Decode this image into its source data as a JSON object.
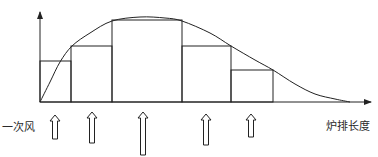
{
  "diagram": {
    "title": "",
    "labels": {
      "primary_air": "一次风",
      "grate_length": "炉排长度"
    },
    "colors": {
      "stroke": "#222222",
      "background": "#ffffff"
    },
    "axes": {
      "origin": [
        40,
        102
      ],
      "y_axis_top": 12,
      "x_axis_end": 371
    },
    "steps": [
      {
        "x0": 40,
        "x1": 71,
        "top": 61
      },
      {
        "x0": 71,
        "x1": 112,
        "top": 46
      },
      {
        "x0": 112,
        "x1": 182,
        "top": 20
      },
      {
        "x0": 182,
        "x1": 231,
        "top": 46
      },
      {
        "x0": 231,
        "x1": 273,
        "top": 70
      }
    ],
    "curve_points": [
      [
        40,
        102
      ],
      [
        50,
        82
      ],
      [
        60,
        62
      ],
      [
        72,
        46
      ],
      [
        90,
        33
      ],
      [
        112,
        21
      ],
      [
        140,
        17
      ],
      [
        165,
        18
      ],
      [
        182,
        21
      ],
      [
        210,
        33
      ],
      [
        231,
        46
      ],
      [
        255,
        60
      ],
      [
        273,
        70
      ],
      [
        295,
        84
      ],
      [
        315,
        94
      ],
      [
        335,
        99
      ],
      [
        350,
        102
      ]
    ],
    "air_arrows": [
      {
        "x": 55,
        "top": 115,
        "bottom": 139
      },
      {
        "x": 92,
        "top": 112,
        "bottom": 143
      },
      {
        "x": 143,
        "top": 112,
        "bottom": 155
      },
      {
        "x": 206,
        "top": 114,
        "bottom": 145
      },
      {
        "x": 251,
        "top": 114,
        "bottom": 137
      }
    ]
  }
}
